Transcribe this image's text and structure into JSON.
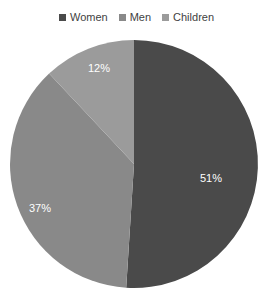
{
  "chart_data": {
    "type": "pie",
    "title": "",
    "subtitle": "",
    "xlabel": "",
    "ylabel": "",
    "grid": false,
    "legend_position": "top",
    "start_angle_deg": 0,
    "direction": "clockwise",
    "categories": [
      "Women",
      "Men",
      "Children"
    ],
    "values": [
      51,
      37,
      12
    ],
    "value_unit": "%",
    "data_labels": [
      "51%",
      "37%",
      "12%"
    ],
    "colors": [
      "#4a4a4a",
      "#898989",
      "#9b9b9b"
    ],
    "slices": [
      {
        "name": "Women",
        "value": 51,
        "label": "51%",
        "color": "#4a4a4a",
        "start_deg": 0,
        "end_deg": 183.6,
        "label_x": 211,
        "label_y": 182
      },
      {
        "name": "Men",
        "value": 37,
        "label": "37%",
        "color": "#898989",
        "start_deg": 183.6,
        "end_deg": 316.8,
        "label_x": 40,
        "label_y": 212
      },
      {
        "name": "Children",
        "value": 12,
        "label": "12%",
        "color": "#9b9b9b",
        "start_deg": 316.8,
        "end_deg": 360,
        "label_x": 99,
        "label_y": 72
      }
    ]
  },
  "legend": {
    "items": [
      {
        "label": "Women",
        "color": "#4a4a4a"
      },
      {
        "label": "Men",
        "color": "#898989"
      },
      {
        "label": "Children",
        "color": "#9b9b9b"
      }
    ]
  },
  "geometry": {
    "center_x": 134,
    "center_y": 164,
    "radius": 124
  }
}
